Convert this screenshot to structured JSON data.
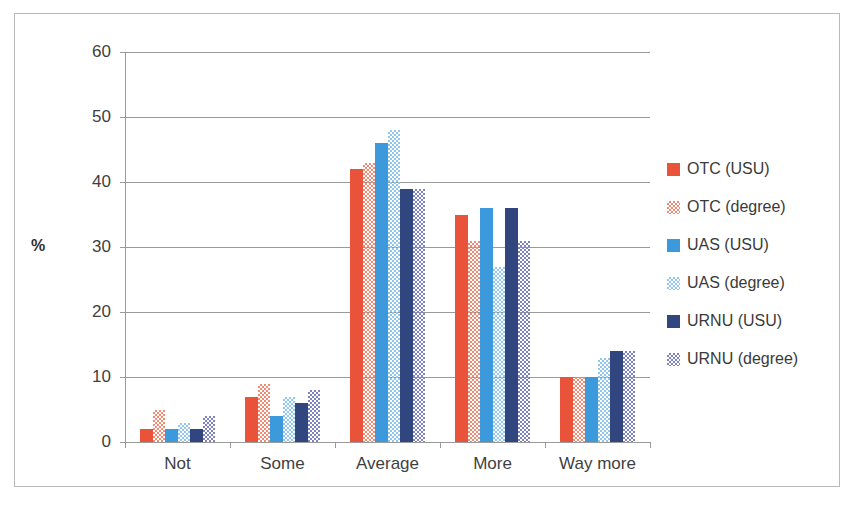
{
  "chart_data": {
    "type": "bar",
    "title": "",
    "xlabel": "",
    "ylabel": "%",
    "ylim": [
      0,
      60
    ],
    "ytick_step": 10,
    "yticks": [
      0,
      10,
      20,
      30,
      40,
      50,
      60
    ],
    "grid": true,
    "legend_position": "right",
    "categories": [
      "Not",
      "Some",
      "Average",
      "More",
      "Way more"
    ],
    "series": [
      {
        "name": "OTC (USU)",
        "color": "#E8533A",
        "fill": "solid",
        "values": [
          2,
          7,
          42,
          35,
          10
        ]
      },
      {
        "name": "OTC (degree)",
        "color": "#F08A72",
        "fill": "check",
        "values": [
          5,
          9,
          43,
          31,
          10
        ]
      },
      {
        "name": "UAS (USU)",
        "color": "#3C99DB",
        "fill": "solid",
        "values": [
          2,
          4,
          46,
          36,
          10
        ]
      },
      {
        "name": "UAS (degree)",
        "color": "#8FC8EC",
        "fill": "check",
        "values": [
          3,
          7,
          48,
          27,
          13
        ]
      },
      {
        "name": "URNU (USU)",
        "color": "#31457E",
        "fill": "solid",
        "values": [
          2,
          6,
          39,
          36,
          14
        ]
      },
      {
        "name": "URNU (degree)",
        "color": "#7D83BE",
        "fill": "check",
        "values": [
          4,
          8,
          39,
          31,
          14
        ]
      }
    ]
  }
}
